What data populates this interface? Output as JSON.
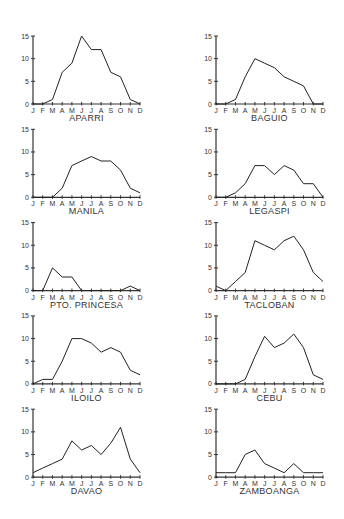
{
  "chart_data": [
    {
      "type": "line",
      "title": "APARRI",
      "categories": [
        "J",
        "F",
        "M",
        "A",
        "M",
        "J",
        "J",
        "A",
        "S",
        "O",
        "N",
        "D"
      ],
      "values": [
        0,
        0,
        1,
        7,
        9,
        15,
        12,
        12,
        7,
        6,
        1,
        0
      ],
      "ylim": [
        0,
        15
      ],
      "yticks": [
        0,
        5,
        10,
        15
      ],
      "xlabel": "",
      "ylabel": "",
      "grid": false
    },
    {
      "type": "line",
      "title": "BAGUIO",
      "categories": [
        "J",
        "F",
        "M",
        "A",
        "M",
        "J",
        "J",
        "A",
        "S",
        "O",
        "N",
        "D"
      ],
      "values": [
        0,
        0,
        1,
        6,
        10,
        9,
        8,
        6,
        5,
        4,
        0,
        0
      ],
      "ylim": [
        0,
        15
      ],
      "yticks": [
        0,
        5,
        10,
        15
      ],
      "xlabel": "",
      "ylabel": "",
      "grid": false
    },
    {
      "type": "line",
      "title": "MANILA",
      "categories": [
        "J",
        "F",
        "M",
        "A",
        "M",
        "J",
        "J",
        "A",
        "S",
        "O",
        "N",
        "D"
      ],
      "values": [
        0,
        0,
        0,
        2,
        7,
        8,
        9,
        8,
        8,
        6,
        2,
        1
      ],
      "ylim": [
        0,
        15
      ],
      "yticks": [
        0,
        5,
        10,
        15
      ],
      "xlabel": "",
      "ylabel": "",
      "grid": false
    },
    {
      "type": "line",
      "title": "LEGASPI",
      "categories": [
        "J",
        "F",
        "M",
        "A",
        "M",
        "J",
        "J",
        "A",
        "S",
        "O",
        "N",
        "D"
      ],
      "values": [
        0,
        0,
        1,
        3,
        7,
        7,
        5,
        7,
        6,
        3,
        3,
        0
      ],
      "ylim": [
        0,
        15
      ],
      "yticks": [
        0,
        5,
        10,
        15
      ],
      "xlabel": "",
      "ylabel": "",
      "grid": false
    },
    {
      "type": "line",
      "title": "PTO. PRINCESA",
      "categories": [
        "J",
        "F",
        "M",
        "A",
        "M",
        "J",
        "J",
        "A",
        "S",
        "O",
        "N",
        "D"
      ],
      "values": [
        0,
        0,
        5,
        3,
        3,
        0,
        0,
        0,
        0,
        0,
        1,
        0
      ],
      "ylim": [
        0,
        15
      ],
      "yticks": [
        0,
        5,
        10,
        15
      ],
      "xlabel": "",
      "ylabel": "",
      "grid": false
    },
    {
      "type": "line",
      "title": "TACLOBAN",
      "categories": [
        "J",
        "F",
        "M",
        "A",
        "M",
        "J",
        "J",
        "A",
        "S",
        "O",
        "N",
        "D"
      ],
      "values": [
        1,
        0,
        2,
        4,
        11,
        10,
        9,
        11,
        12,
        9,
        4,
        2
      ],
      "ylim": [
        0,
        15
      ],
      "yticks": [
        0,
        5,
        10,
        15
      ],
      "xlabel": "",
      "ylabel": "",
      "grid": false
    },
    {
      "type": "line",
      "title": "ILOILO",
      "categories": [
        "J",
        "F",
        "M",
        "A",
        "M",
        "J",
        "J",
        "A",
        "S",
        "O",
        "N",
        "D"
      ],
      "values": [
        0,
        1,
        1,
        5,
        10,
        10,
        9,
        7,
        8,
        7,
        3,
        2
      ],
      "ylim": [
        0,
        15
      ],
      "yticks": [
        0,
        5,
        10,
        15
      ],
      "xlabel": "",
      "ylabel": "",
      "grid": false
    },
    {
      "type": "line",
      "title": "CEBU",
      "categories": [
        "J",
        "F",
        "M",
        "A",
        "M",
        "J",
        "J",
        "A",
        "S",
        "O",
        "N",
        "D"
      ],
      "values": [
        0,
        0,
        0,
        1,
        6,
        10.5,
        8,
        9,
        11,
        8,
        2,
        1
      ],
      "ylim": [
        0,
        15
      ],
      "yticks": [
        0,
        5,
        10,
        15
      ],
      "xlabel": "",
      "ylabel": "",
      "grid": false
    },
    {
      "type": "line",
      "title": "DAVAO",
      "categories": [
        "J",
        "F",
        "M",
        "A",
        "M",
        "J",
        "J",
        "A",
        "S",
        "O",
        "N",
        "D"
      ],
      "values": [
        1,
        2,
        3,
        4,
        8,
        6,
        7,
        5,
        7.5,
        11,
        4,
        1
      ],
      "ylim": [
        0,
        15
      ],
      "yticks": [
        0,
        5,
        10,
        15
      ],
      "xlabel": "",
      "ylabel": "",
      "grid": false
    },
    {
      "type": "line",
      "title": "ZAMBOANGA",
      "categories": [
        "J",
        "F",
        "M",
        "A",
        "M",
        "J",
        "J",
        "A",
        "S",
        "O",
        "N",
        "D"
      ],
      "values": [
        1,
        1,
        1,
        5,
        6,
        3,
        2,
        1,
        3,
        1,
        1,
        1
      ],
      "ylim": [
        0,
        15
      ],
      "yticks": [
        0,
        5,
        10,
        15
      ],
      "xlabel": "",
      "ylabel": "",
      "grid": false
    }
  ]
}
